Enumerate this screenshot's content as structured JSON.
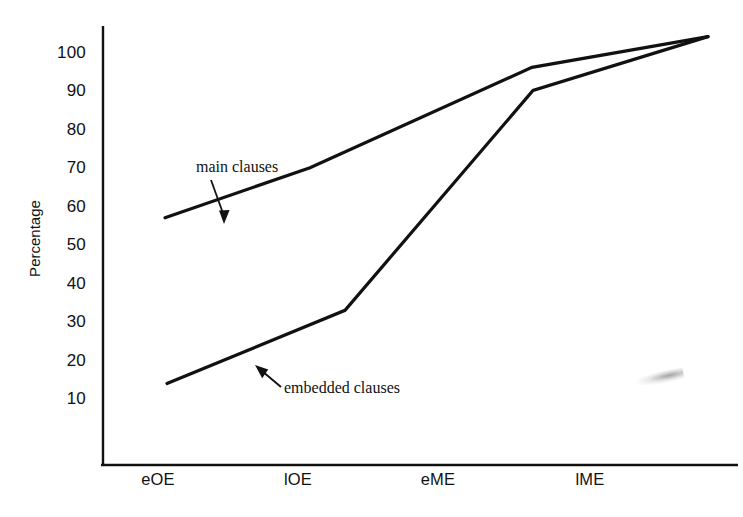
{
  "chart_data": {
    "type": "line",
    "title": "",
    "xlabel": "",
    "ylabel": "Percentage",
    "categories": [
      "eOE",
      "lOE",
      "eME",
      "lME"
    ],
    "ylim": [
      0,
      110
    ],
    "yticks": [
      10,
      20,
      30,
      40,
      50,
      60,
      70,
      80,
      90,
      100
    ],
    "ytick_labels": [
      "10",
      "20",
      "30",
      "40",
      "50",
      "60",
      "70",
      "80",
      "90",
      "100"
    ],
    "grid": false,
    "legend": "none",
    "series": [
      {
        "name": "main clauses",
        "values": [
          57,
          70,
          96,
          104
        ],
        "color": "#111111"
      },
      {
        "name": "embedded clauses",
        "values": [
          14,
          33,
          90,
          104
        ],
        "color": "#111111"
      }
    ],
    "annotations": [
      {
        "text": "main clauses",
        "points_to_series": "main clauses",
        "arrow": "down"
      },
      {
        "text": "embedded clauses",
        "points_to_series": "embedded clauses",
        "arrow": "up-left"
      }
    ]
  },
  "axis": {
    "y_title": "Percentage",
    "y_labels": [
      "100",
      "90",
      "80",
      "70",
      "60",
      "50",
      "40",
      "30",
      "20",
      "10"
    ],
    "x_labels": [
      "eOE",
      "lOE",
      "eME",
      "lME"
    ]
  },
  "annotations": {
    "main": "main clauses",
    "embedded": "embedded clauses"
  },
  "colors": {
    "ink": "#111111",
    "background": "#ffffff"
  }
}
